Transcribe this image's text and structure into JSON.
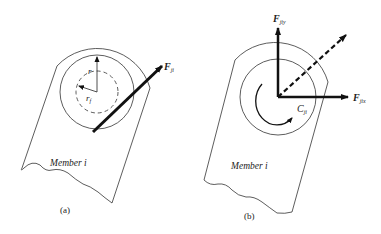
{
  "panel_a": {
    "caption": "(a)",
    "member_label": "Member i",
    "force_label": "F",
    "force_sub": "ji",
    "radius_label": "r",
    "friction_radius_label": "r",
    "friction_radius_sub": "f"
  },
  "panel_b": {
    "caption": "(b)",
    "member_label": "Member i",
    "force_y_label": "F",
    "force_y_sub": "jiy",
    "force_x_label": "F",
    "force_x_sub": "jix",
    "couple_label": "C",
    "couple_sub": "ji"
  },
  "colors": {
    "line": "#333333",
    "arrow": "#111111"
  }
}
